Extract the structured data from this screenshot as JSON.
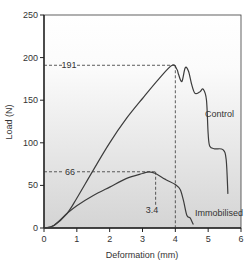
{
  "chart_data": {
    "type": "line",
    "title": "",
    "xlabel": "Deformation (mm)",
    "ylabel": "Load (N)",
    "xlim": [
      0,
      6
    ],
    "ylim": [
      0,
      250
    ],
    "xticks": [
      0,
      1,
      2,
      3,
      4,
      5,
      6
    ],
    "yticks": [
      0,
      50,
      100,
      150,
      200,
      250
    ],
    "grid": false,
    "legend": "inline labels",
    "series": [
      {
        "name": "Control",
        "x": [
          0,
          0.3,
          0.7,
          1,
          1.5,
          2,
          2.5,
          3,
          3.5,
          3.9,
          4.05,
          4.1,
          4.2,
          4.3,
          4.4,
          4.5,
          4.6,
          4.75,
          4.85,
          4.95,
          5.0,
          5.05,
          5.2,
          5.45,
          5.55,
          5.6
        ],
        "y": [
          0,
          3,
          17,
          35,
          68,
          100,
          128,
          152,
          175,
          191,
          186,
          180,
          172,
          188,
          184,
          168,
          158,
          160,
          163,
          150,
          110,
          96,
          93,
          92,
          80,
          40
        ]
      },
      {
        "name": "Immobilised",
        "x": [
          0,
          0.3,
          0.7,
          1,
          1.5,
          2,
          2.5,
          3,
          3.2,
          3.4,
          3.7,
          4,
          4.15,
          4.25,
          4.35,
          4.45,
          4.5,
          4.55
        ],
        "y": [
          0,
          3,
          17,
          26,
          38,
          48,
          58,
          64,
          66,
          64,
          57,
          51,
          45,
          32,
          15,
          12,
          8,
          4
        ]
      }
    ],
    "annotations": [
      {
        "text": "191",
        "type": "hline",
        "y": 191,
        "x_to": 4.0
      },
      {
        "text": "66",
        "type": "hline",
        "y": 66,
        "x_to": 3.4
      },
      {
        "text": "3.4",
        "type": "vline",
        "x": 3.4,
        "y_from": 66
      },
      {
        "type": "vline",
        "x": 4.0,
        "y_from": 191
      }
    ],
    "series_labels": {
      "control": "Control",
      "immobilised": "Immobilised"
    }
  },
  "labels": {
    "xlabel": "Deformation (mm)",
    "ylabel": "Load (N)",
    "control": "Control",
    "immobilised": "Immobilised",
    "peak_control": "191",
    "peak_immobilised": "66",
    "peak_immobilised_x": "3.4"
  }
}
